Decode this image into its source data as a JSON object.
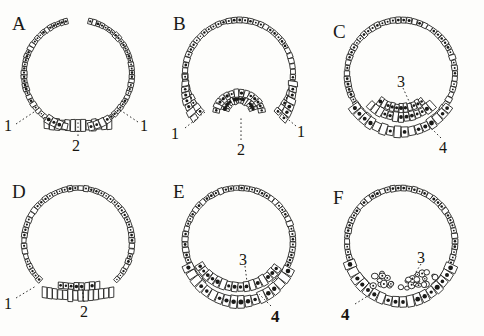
{
  "figure": {
    "background_color": "#fdfdfb",
    "ink_color": "#1a1a18",
    "rows": 2,
    "columns": 3,
    "panel_size": [
      161,
      168
    ]
  },
  "panels": [
    {
      "id": "A",
      "letter": "A",
      "letter_pos": [
        12,
        14
      ],
      "origin": [
        0,
        0
      ],
      "description": "Blastula with open blastoderm gap at animal pole and flattened thickened ventral plate",
      "labels": [
        {
          "text": "1",
          "x": 4,
          "y": 118,
          "bold": false,
          "leader": [
            [
              16,
              124
            ],
            [
              34,
              112
            ]
          ]
        },
        {
          "text": "1",
          "x": 140,
          "y": 118,
          "bold": false,
          "leader": [
            [
              138,
              122
            ],
            [
              120,
              110
            ]
          ]
        },
        {
          "text": "2",
          "x": 72,
          "y": 138,
          "bold": false,
          "leader": [
            [
              78,
              136
            ],
            [
              78,
              122
            ]
          ]
        }
      ]
    },
    {
      "id": "B",
      "letter": "B",
      "letter_pos": [
        12,
        14
      ],
      "origin": [
        161,
        0
      ],
      "description": "Invagination stage: horseshoe-shaped blastopore pocket at vegetal pole",
      "labels": [
        {
          "text": "1",
          "x": 10,
          "y": 126,
          "bold": false,
          "leader": [
            [
              24,
              128
            ],
            [
              44,
              112
            ]
          ]
        },
        {
          "text": "1",
          "x": 136,
          "y": 124,
          "bold": false,
          "leader": [
            [
              135,
              126
            ],
            [
              116,
              110
            ]
          ]
        },
        {
          "text": "2",
          "x": 76,
          "y": 142,
          "bold": false,
          "leader": [
            [
              80,
              140
            ],
            [
              80,
              116
            ]
          ]
        }
      ]
    },
    {
      "id": "C",
      "letter": "C",
      "letter_pos": [
        10,
        22
      ],
      "origin": [
        323,
        0
      ],
      "description": "Archenteron roof formed; thickened ventral mass with inner cell band",
      "labels": [
        {
          "text": "3",
          "x": 74,
          "y": 74,
          "bold": false,
          "leader": [
            [
              80,
              88
            ],
            [
              90,
              110
            ]
          ]
        },
        {
          "text": "4",
          "x": 116,
          "y": 140,
          "bold": false,
          "leader": [
            [
              118,
              138
            ],
            [
              104,
              124
            ]
          ]
        }
      ]
    },
    {
      "id": "D",
      "letter": "D",
      "letter_pos": [
        12,
        14
      ],
      "origin": [
        0,
        168
      ],
      "description": "Flattened ventral blastoderm thickening, early endoderm plate",
      "labels": [
        {
          "text": "1",
          "x": 4,
          "y": 128,
          "bold": false,
          "leader": [
            [
              16,
              130
            ],
            [
              36,
              118
            ]
          ]
        },
        {
          "text": "2",
          "x": 80,
          "y": 136,
          "bold": false,
          "leader": [
            [
              84,
              134
            ],
            [
              82,
              120
            ]
          ]
        }
      ]
    },
    {
      "id": "E",
      "letter": "E",
      "letter_pos": [
        12,
        14
      ],
      "origin": [
        161,
        168
      ],
      "description": "Two-layered ventral plate: ectoderm above, thick endoderm crescent below",
      "labels": [
        {
          "text": "3",
          "x": 78,
          "y": 84,
          "bold": false,
          "leader": [
            [
              84,
              98
            ],
            [
              86,
              114
            ]
          ]
        },
        {
          "text": "4",
          "x": 110,
          "y": 140,
          "bold": true,
          "leader": [
            [
              110,
              138
            ],
            [
              98,
              126
            ]
          ]
        }
      ]
    },
    {
      "id": "F",
      "letter": "F",
      "letter_pos": [
        10,
        20
      ],
      "origin": [
        323,
        168
      ],
      "description": "Mesoderm proliferation: irregular cell clusters between ectoderm and endoderm",
      "labels": [
        {
          "text": "3",
          "x": 94,
          "y": 82,
          "bold": false,
          "leader": [
            [
              98,
              96
            ],
            [
              88,
              112
            ]
          ]
        },
        {
          "text": "4",
          "x": 18,
          "y": 138,
          "bold": true,
          "leader": [
            [
              32,
              136
            ],
            [
              48,
              126
            ]
          ]
        }
      ]
    }
  ],
  "legend_keys": {
    "1": "blastoderm margin",
    "2": "blastopore / ventral groove",
    "3": "archenteron cavity",
    "4": "endoderm layer"
  }
}
